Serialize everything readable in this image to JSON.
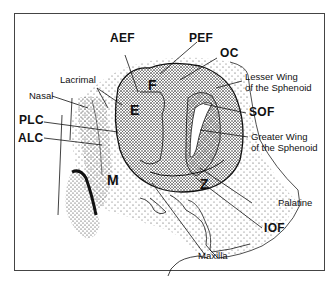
{
  "figure": {
    "type": "anatomical-line-drawing",
    "colors": {
      "ink": "#111111",
      "frame": "#444444",
      "background": "#ffffff"
    }
  },
  "labels": {
    "AEF": "AEF",
    "PEF": "PEF",
    "OC": "OC",
    "lacrimal": "Lacrimal",
    "nasal": "Nasal",
    "lesser_wing_line1": "Lesser Wing",
    "lesser_wing_line2": "of the Sphenoid",
    "SOF": "SOF",
    "PLC": "PLC",
    "ALC": "ALC",
    "greater_wing_line1": "Greater Wing",
    "greater_wing_line2": "of the Sphenoid",
    "palatine": "Palatine",
    "IOF": "IOF",
    "maxilla": "Maxilla"
  },
  "regions": {
    "F": "F",
    "E": "E",
    "M": "M",
    "Z": "Z"
  }
}
